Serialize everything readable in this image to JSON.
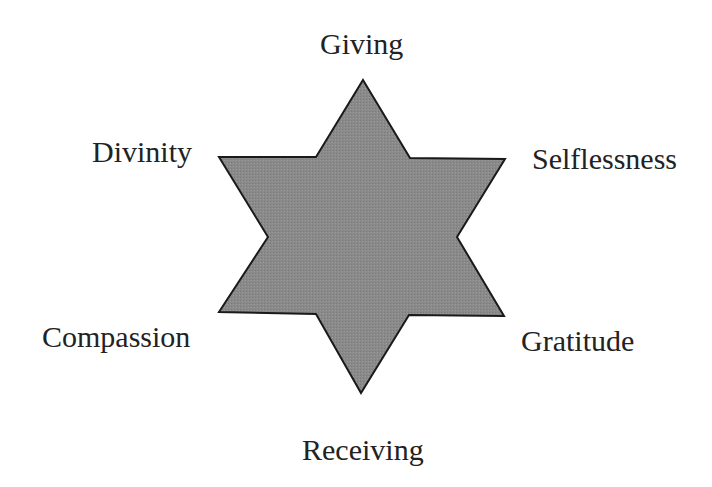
{
  "diagram": {
    "type": "hexagram",
    "shape": {
      "fill": "#8a8a8a",
      "stroke": "#1a1a1a",
      "stroke_width": 2,
      "points": "363,80 410,158 505,159 457,237 504,316 409,315 361,393 316,314 219,312 268,237 219,157 316,157"
    },
    "labels": [
      {
        "id": "top",
        "text": "Giving"
      },
      {
        "id": "upper-left",
        "text": "Divinity"
      },
      {
        "id": "upper-right",
        "text": "Selflessness"
      },
      {
        "id": "lower-left",
        "text": "Compassion"
      },
      {
        "id": "lower-right",
        "text": "Gratitude"
      },
      {
        "id": "bottom",
        "text": "Receiving"
      }
    ]
  }
}
